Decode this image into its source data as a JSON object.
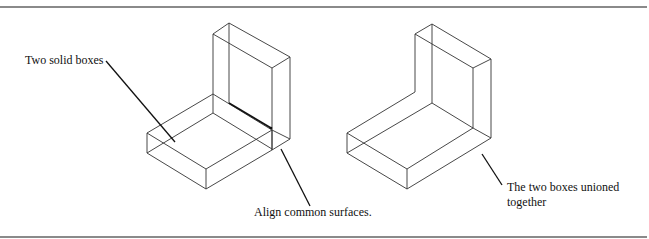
{
  "figure": {
    "left_panel": {
      "callout_boxes": "Two solid boxes",
      "callout_align": "Align common surfaces."
    },
    "right_panel": {
      "callout_union_line1": "The two boxes unioned",
      "callout_union_line2": "together"
    },
    "colors": {
      "line": "#333333",
      "rule": "#8a8a8a",
      "background": "#ffffff"
    }
  }
}
